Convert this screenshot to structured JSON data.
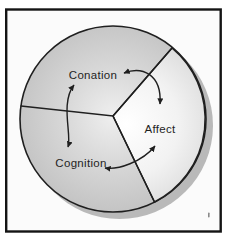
{
  "diagram": {
    "segments": [
      {
        "label": "Conation"
      },
      {
        "label": "Affect"
      },
      {
        "label": "Cognition"
      }
    ],
    "relations": [
      {
        "from": "Conation",
        "to": "Affect",
        "bidirectional": true
      },
      {
        "from": "Conation",
        "to": "Cognition",
        "bidirectional": true
      },
      {
        "from": "Cognition",
        "to": "Affect",
        "bidirectional": true
      }
    ],
    "colors": {
      "background": "#fbfbfb",
      "frame": "#141414",
      "outline": "#1f1f1f",
      "shadow": "#b9b9b9",
      "text": "#1f1f1f",
      "wedge_dark_center": "#efefef",
      "wedge_dark_mid": "#d8d8d8",
      "wedge_dark_edge": "#c4c4c4",
      "wedge_light_center": "#ffffff",
      "wedge_light_mid": "#f2f2f2",
      "wedge_light_edge": "#dadada",
      "artifact": "#8a8a8a"
    }
  }
}
